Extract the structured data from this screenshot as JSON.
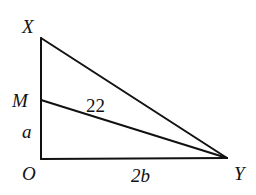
{
  "diagram": {
    "type": "geometry-right-triangle",
    "points": {
      "X": {
        "label": "X",
        "x": 41,
        "y": 38
      },
      "M": {
        "label": "M",
        "x": 41,
        "y": 100
      },
      "O": {
        "label": "O",
        "x": 41,
        "y": 159
      },
      "Y": {
        "label": "Y",
        "x": 227,
        "y": 158
      }
    },
    "segments": [
      {
        "from": "X",
        "to": "O"
      },
      {
        "from": "O",
        "to": "Y"
      },
      {
        "from": "X",
        "to": "Y"
      },
      {
        "from": "M",
        "to": "Y"
      }
    ],
    "labels": {
      "segment_MY": "22",
      "segment_OM": "a",
      "segment_OY": "2b"
    },
    "right_angle_at": "O"
  }
}
